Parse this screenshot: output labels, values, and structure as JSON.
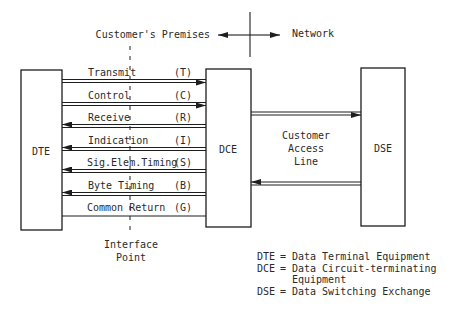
{
  "header": {
    "left_label": "Customer's Premises",
    "right_label": "Network"
  },
  "boxes": {
    "dte": "DTE",
    "dce": "DCE",
    "dse": "DSE"
  },
  "signals": [
    {
      "name": "Transmit",
      "code": "(T)",
      "direction": "to-dce"
    },
    {
      "name": "Control",
      "code": "(C)",
      "direction": "to-dce"
    },
    {
      "name": "Receive",
      "code": "(R)",
      "direction": "to-dte"
    },
    {
      "name": "Indication",
      "code": "(I)",
      "direction": "to-dte"
    },
    {
      "name": "Sig.Elem.Timing",
      "code": "(S)",
      "direction": "to-dte"
    },
    {
      "name": "Byte Timing",
      "code": "(B)",
      "direction": "to-dte"
    },
    {
      "name": "Common Return",
      "code": "(G)",
      "direction": "none"
    }
  ],
  "access_line": {
    "lines": [
      "Customer",
      "Access",
      "Line"
    ],
    "upper_direction": "to-dse",
    "lower_direction": "to-dce"
  },
  "interface": {
    "lines": [
      "Interface",
      "Point"
    ]
  },
  "legend": [
    {
      "abbr": "DTE",
      "eq": "=",
      "text": "Data Terminal Equipment"
    },
    {
      "abbr": "DCE",
      "eq": "=",
      "text": "Data Circuit-terminating"
    },
    {
      "abbr": "",
      "eq": "",
      "text": "Equipment"
    },
    {
      "abbr": "DSE",
      "eq": "=",
      "text": "Data Switching Exchange"
    }
  ]
}
